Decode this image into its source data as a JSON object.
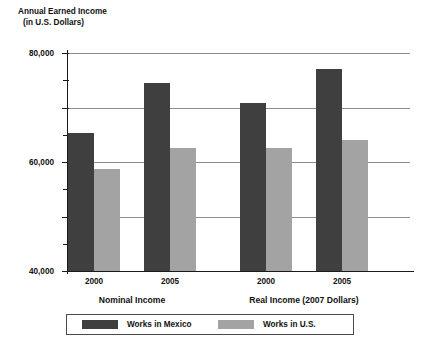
{
  "chart_data": {
    "type": "bar",
    "title": "Annual Earned Income",
    "subtitle": "(in U.S. Dollars)",
    "xlabel": "",
    "ylabel": "Annual Earned Income (in U.S. Dollars)",
    "ylim": [
      0,
      80000
    ],
    "ytick_labels": [
      "0",
      "20,000",
      "40,000",
      "60,000",
      "80,000"
    ],
    "ytick_values": [
      0,
      20000,
      40000,
      60000,
      80000
    ],
    "minor_tick_values": [
      10000,
      30000,
      50000,
      70000
    ],
    "grid": "horizontal-major-only",
    "legend_position": "bottom-center",
    "categories": [
      "2000",
      "2005",
      "2000",
      "2005"
    ],
    "groups": [
      {
        "label": "Nominal Income",
        "categories": [
          "2000",
          "2005"
        ]
      },
      {
        "label": "Real Income (2007 Dollars)",
        "categories": [
          "2000",
          "2005"
        ]
      }
    ],
    "series": [
      {
        "name": "Works in Mexico",
        "color": "#3f3f3f",
        "values": [
          50500,
          69000,
          61500,
          74000
        ]
      },
      {
        "name": "Works in U.S.",
        "color": "#a3a3a3",
        "values": [
          37500,
          45000,
          45000,
          48000
        ]
      }
    ]
  },
  "legend": {
    "items": [
      {
        "label": "Works in Mexico",
        "color": "#3f3f3f"
      },
      {
        "label": "Works in U.S.",
        "color": "#a3a3a3"
      }
    ]
  },
  "colors": {
    "mexico": "#3f3f3f",
    "us": "#a3a3a3",
    "axis": "#1a1a1a",
    "gridline": "#8d8d8d",
    "background": "#ffffff"
  }
}
